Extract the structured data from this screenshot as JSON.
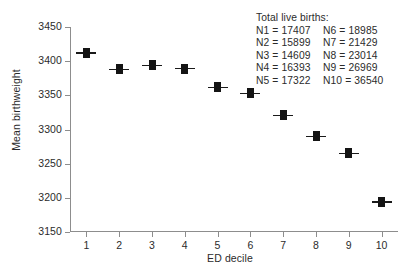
{
  "chart_data": {
    "type": "scatter",
    "title": "",
    "xlabel": "ED decile",
    "ylabel": "Mean birthweight",
    "categories": [
      "1",
      "2",
      "3",
      "4",
      "5",
      "6",
      "7",
      "8",
      "9",
      "10"
    ],
    "x": [
      1,
      2,
      3,
      4,
      5,
      6,
      7,
      8,
      9,
      10
    ],
    "values": [
      3412,
      3388,
      3394,
      3389,
      3362,
      3353,
      3321,
      3290,
      3265,
      3194
    ],
    "series": [
      {
        "name": "Mean birthweight",
        "values": [
          3412,
          3388,
          3394,
          3389,
          3362,
          3353,
          3321,
          3290,
          3265,
          3194
        ]
      }
    ],
    "ylim": [
      3150,
      3450
    ],
    "xlim": [
      0.5,
      10.5
    ],
    "yticks": [
      3450,
      3400,
      3350,
      3300,
      3250,
      3200,
      3150
    ],
    "ytick_labels": [
      "3450",
      "3400",
      "3350",
      "3300",
      "3250",
      "3200",
      "3150"
    ],
    "xticks": [
      1,
      2,
      3,
      4,
      5,
      6,
      7,
      8,
      9,
      10
    ],
    "xtick_labels": [
      "1",
      "2",
      "3",
      "4",
      "5",
      "6",
      "7",
      "8",
      "9",
      "10"
    ],
    "grid": false,
    "legend_position": "top-right",
    "marker": "filled-square-with-horizontal-error-bar",
    "marker_color": "#141414",
    "axis_color": "#8d8d8d",
    "background_color": "#ffffff"
  },
  "legend": {
    "title": "Total live births:",
    "rows": [
      {
        "left": "N1 = 17407",
        "right": "N6 = 18985"
      },
      {
        "left": "N2 = 15899",
        "right": "N7 = 21429"
      },
      {
        "left": "N3 = 14609",
        "right": "N8 = 23014"
      },
      {
        "left": "N4 = 16393",
        "right": "N9 = 26969"
      },
      {
        "left": "N5 = 17322",
        "right": "N10 = 36540"
      }
    ]
  }
}
